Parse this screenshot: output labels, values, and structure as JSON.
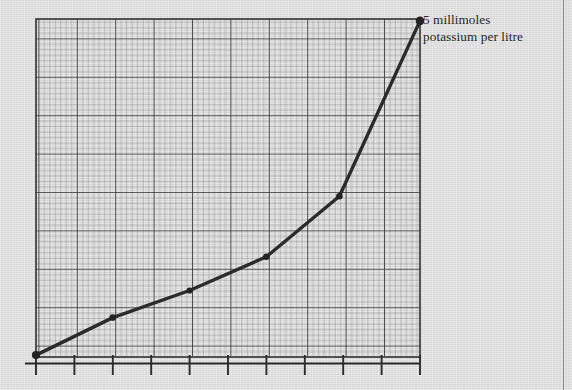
{
  "figure": {
    "kind": "line-graph-on-graph-paper",
    "background_color": "#dcdcdc",
    "ink_color": "#2b2b2b",
    "grid_major_color": "#3a3a3a",
    "grid_minor_color": "#7d7d7d",
    "page_rule_color": "#8d8d8d"
  },
  "annotation": {
    "text": "5 millimoles\npotassium per litre",
    "line1": "5 millimoles",
    "line2": "potassium per litre",
    "anchor": "curve-endpoint-top-right"
  },
  "chart_data": {
    "type": "line",
    "title": "",
    "xlabel": "",
    "ylabel": "",
    "grid": true,
    "grid_major_divisions_x": 10,
    "grid_major_divisions_y": 9,
    "grid_minor_per_major": 7,
    "legend_position": "none",
    "axis_ticks_below_x_axis": true,
    "xlim": [
      0,
      10
    ],
    "ylim": [
      0,
      9
    ],
    "x": [
      0,
      2.0,
      4.0,
      6.0,
      7.9,
      10.0
    ],
    "values": [
      0.05,
      1.05,
      1.77,
      2.67,
      4.28,
      8.95
    ],
    "annotations": [
      {
        "at_point_index": 5,
        "text": "5 millimoles potassium per litre"
      }
    ],
    "markers": [
      {
        "x": 0,
        "y": 0.05
      },
      {
        "x": 2.0,
        "y": 1.05
      },
      {
        "x": 4.0,
        "y": 1.77
      },
      {
        "x": 6.0,
        "y": 2.67
      },
      {
        "x": 7.9,
        "y": 4.28
      },
      {
        "x": 10.0,
        "y": 8.95
      }
    ]
  }
}
